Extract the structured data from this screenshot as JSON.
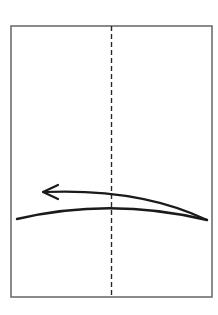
{
  "diagram": {
    "type": "folding-instruction",
    "colors": {
      "background": "#ffffff",
      "paper_outline": "#6e6e6e",
      "crease_line": "#2a2a2a",
      "arrow": "#1a1a1a"
    },
    "paper": {
      "x": 11,
      "y": 26,
      "width": 201,
      "height": 271
    },
    "crease": {
      "style": "valley-fold-dashed",
      "x": 111.5,
      "y1": 26,
      "y2": 297,
      "dash": "5 3"
    },
    "fold_arrow": {
      "direction": "right-to-left",
      "tail_curve": "M17 219 Q 111 197 207 220",
      "head_curve": "M207 220 Q 140 188 44 192",
      "arrowhead": "M58 185 L 43 192 L 58 199"
    }
  }
}
